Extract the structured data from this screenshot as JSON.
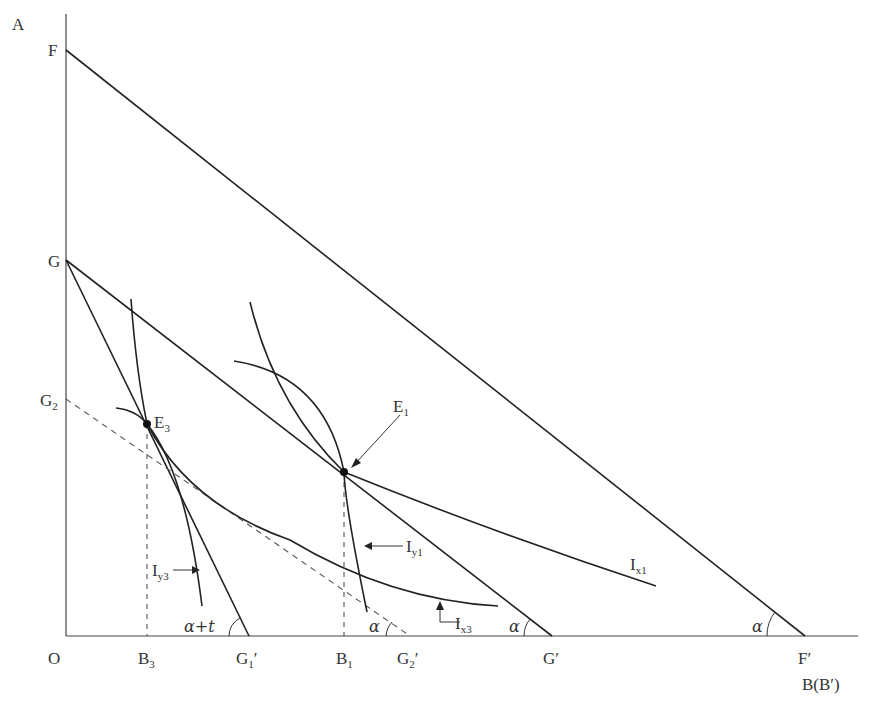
{
  "diagram": {
    "axes": {
      "y_axis_label": "A",
      "x_axis_label": "B(B′)",
      "origin_label": "O"
    },
    "y_axis_points": [
      {
        "id": "F",
        "label": "F"
      },
      {
        "id": "G",
        "label": "G"
      },
      {
        "id": "G2",
        "label": "G",
        "sub": "2"
      }
    ],
    "x_axis_points": [
      {
        "id": "B3",
        "label": "B",
        "sub": "3"
      },
      {
        "id": "G1p",
        "label": "G",
        "sub": "1",
        "prime": "′"
      },
      {
        "id": "B1",
        "label": "B",
        "sub": "1"
      },
      {
        "id": "G2p",
        "label": "G",
        "sub": "2",
        "prime": "′"
      },
      {
        "id": "Gp",
        "label": "G′"
      },
      {
        "id": "Fp",
        "label": "F′"
      }
    ],
    "lines": [
      {
        "id": "FF",
        "from": "F",
        "to": "F′",
        "style": "solid"
      },
      {
        "id": "GG",
        "from": "G",
        "to": "G′",
        "style": "solid"
      },
      {
        "id": "GG1",
        "from": "G",
        "to": "G1′",
        "style": "solid"
      },
      {
        "id": "G2G2",
        "from": "G2",
        "to": "G2′",
        "style": "dashed"
      }
    ],
    "equilibria": [
      {
        "id": "E1",
        "label": "E",
        "sub": "1"
      },
      {
        "id": "E3",
        "label": "E",
        "sub": "3"
      }
    ],
    "curves": [
      {
        "id": "Ix1",
        "label": "I",
        "sub": "x1"
      },
      {
        "id": "Iy1",
        "label": "I",
        "sub": "y1"
      },
      {
        "id": "Ix3",
        "label": "I",
        "sub": "x3"
      },
      {
        "id": "Iy3",
        "label": "I",
        "sub": "y3"
      }
    ],
    "angles": {
      "alpha": "α",
      "alpha_plus_t": "α+t"
    }
  }
}
